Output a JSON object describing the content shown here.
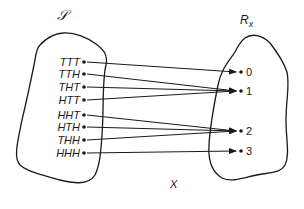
{
  "diagram": {
    "sample_space": {
      "label": "𝒮",
      "outcomes": [
        "TTT",
        "TTH",
        "THT",
        "HTT",
        "HHT",
        "HTH",
        "THH",
        "HHH"
      ]
    },
    "range": {
      "label_main": "R",
      "label_sub": "x",
      "values": [
        "0",
        "1",
        "2",
        "3"
      ]
    },
    "function_label": "X",
    "mapping": [
      {
        "from": "TTT",
        "to": "0"
      },
      {
        "from": "TTH",
        "to": "1"
      },
      {
        "from": "THT",
        "to": "1"
      },
      {
        "from": "HTT",
        "to": "1"
      },
      {
        "from": "HHT",
        "to": "2"
      },
      {
        "from": "HTH",
        "to": "2"
      },
      {
        "from": "THH",
        "to": "2"
      },
      {
        "from": "HHH",
        "to": "3"
      }
    ]
  }
}
